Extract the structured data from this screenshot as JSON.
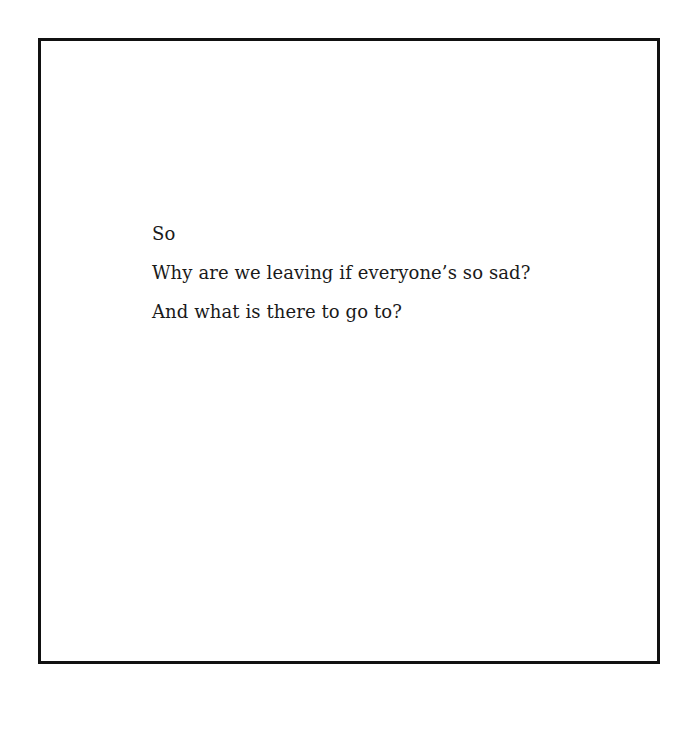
{
  "page": {
    "lines": [
      "So",
      "Why are we leaving if everyone’s so sad?",
      "And what is there to go to?"
    ]
  }
}
